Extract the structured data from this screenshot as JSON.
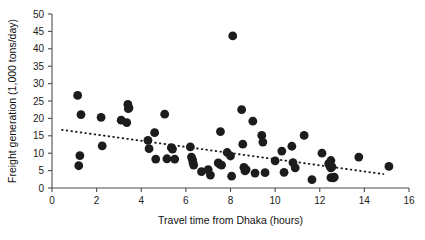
{
  "chart_data": {
    "type": "scatter",
    "title": "",
    "xlabel": "Travel time from Dhaka (hours)",
    "ylabel": "Freight generation (1,000 tons/day)",
    "xlim": [
      0,
      16
    ],
    "ylim": [
      0,
      50
    ],
    "xticks": [
      0,
      2,
      4,
      6,
      8,
      10,
      12,
      14,
      16
    ],
    "yticks": [
      0,
      5,
      10,
      15,
      20,
      25,
      30,
      35,
      40,
      45,
      50
    ],
    "xtick_labels": [
      "0",
      "2",
      "4",
      "6",
      "8",
      "10",
      "12",
      "14",
      "16"
    ],
    "ytick_labels": [
      "0",
      "5",
      "10",
      "15",
      "20",
      "25",
      "30",
      "35",
      "40",
      "45",
      "50"
    ],
    "grid": false,
    "legend": false,
    "marker_color": "#1c1c1c",
    "marker_size": 4.4,
    "series": [
      {
        "name": "District freight generation",
        "points": [
          [
            1.15,
            26.6
          ],
          [
            1.2,
            6.4
          ],
          [
            1.25,
            9.3
          ],
          [
            1.3,
            21.1
          ],
          [
            2.2,
            20.3
          ],
          [
            2.25,
            12.1
          ],
          [
            3.1,
            19.5
          ],
          [
            3.35,
            18.8
          ],
          [
            3.4,
            24.0
          ],
          [
            3.45,
            23.0
          ],
          [
            3.42,
            22.8
          ],
          [
            4.3,
            13.7
          ],
          [
            4.35,
            11.3
          ],
          [
            4.6,
            15.9
          ],
          [
            4.65,
            8.3
          ],
          [
            5.05,
            21.2
          ],
          [
            5.15,
            8.4
          ],
          [
            5.35,
            11.6
          ],
          [
            5.4,
            11.2
          ],
          [
            5.5,
            8.3
          ],
          [
            6.2,
            11.8
          ],
          [
            6.25,
            8.9
          ],
          [
            6.3,
            8.1
          ],
          [
            6.32,
            7.3
          ],
          [
            6.35,
            6.6
          ],
          [
            6.7,
            4.7
          ],
          [
            7.0,
            5.3
          ],
          [
            7.1,
            3.7
          ],
          [
            7.45,
            7.2
          ],
          [
            7.5,
            6.9
          ],
          [
            7.55,
            16.2
          ],
          [
            7.6,
            6.6
          ],
          [
            7.85,
            10.2
          ],
          [
            8.0,
            9.2
          ],
          [
            8.05,
            3.4
          ],
          [
            8.1,
            43.7
          ],
          [
            8.5,
            22.5
          ],
          [
            8.55,
            12.6
          ],
          [
            8.6,
            5.9
          ],
          [
            8.65,
            4.9
          ],
          [
            8.7,
            5.3
          ],
          [
            9.0,
            19.2
          ],
          [
            9.1,
            4.3
          ],
          [
            9.4,
            15.1
          ],
          [
            9.45,
            13.2
          ],
          [
            9.55,
            4.4
          ],
          [
            10.0,
            7.8
          ],
          [
            10.3,
            10.6
          ],
          [
            10.4,
            4.5
          ],
          [
            10.75,
            12.0
          ],
          [
            10.8,
            7.3
          ],
          [
            10.9,
            5.8
          ],
          [
            11.3,
            15.1
          ],
          [
            11.65,
            2.4
          ],
          [
            12.1,
            10.0
          ],
          [
            12.4,
            7.0
          ],
          [
            12.45,
            6.3
          ],
          [
            12.5,
            5.8
          ],
          [
            12.5,
            7.9
          ],
          [
            12.55,
            6.1
          ],
          [
            12.5,
            3.0
          ],
          [
            12.6,
            2.9
          ],
          [
            12.65,
            3.1
          ],
          [
            13.75,
            8.9
          ],
          [
            15.1,
            6.2
          ]
        ]
      }
    ],
    "trendline": {
      "style": "dotted",
      "x_start": 0.45,
      "y_start": 16.7,
      "x_end": 14.85,
      "y_end": 4.0
    }
  }
}
